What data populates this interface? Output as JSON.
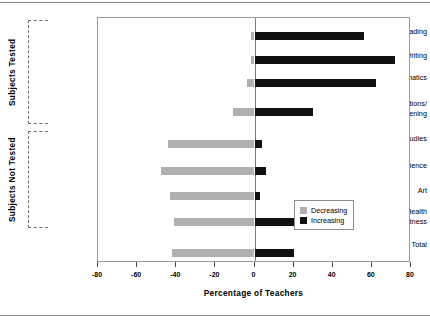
{
  "chart_data": {
    "type": "bar",
    "orientation": "horizontal",
    "title": "",
    "xlabel": "Percentage of Teachers",
    "ylabel": "",
    "xlim": [
      -80,
      80
    ],
    "xticks": [
      -80,
      -60,
      -40,
      -20,
      0,
      20,
      40,
      60,
      80
    ],
    "xtick_labels": [
      "-80",
      "-60",
      "-40",
      "-20",
      "0",
      "20",
      "40",
      "60",
      "80"
    ],
    "grid": false,
    "legend_position": "center right",
    "categories": [
      "Reading",
      "Writing",
      "Mathematics",
      "Communications/ Listening",
      "Social Studies",
      "Science",
      "Art",
      "Health and Fitness",
      "Total"
    ],
    "series": [
      {
        "name": "Decreasing",
        "color": "#b0b0b0",
        "values": [
          -2,
          -2,
          -4,
          -11,
          -44,
          -48,
          -43,
          -41,
          -42
        ]
      },
      {
        "name": "Increasing",
        "color": "#111111",
        "values": [
          56,
          72,
          62,
          30,
          4,
          6,
          3,
          20,
          20
        ]
      }
    ],
    "groups": [
      {
        "label": "Subjects Tested",
        "categories": [
          "Reading",
          "Writing",
          "Mathematics",
          "Communications/ Listening"
        ]
      },
      {
        "label": "Subjects Not Tested",
        "categories": [
          "Social Studies",
          "Science",
          "Art",
          "Health and Fitness"
        ]
      }
    ]
  },
  "axis": {
    "x_title": "Percentage of Teachers"
  },
  "categories": [
    {
      "line1": "Reading",
      "line2": ""
    },
    {
      "line1": "Writing",
      "line2": ""
    },
    {
      "line1": "Mathematics",
      "line2": ""
    },
    {
      "line1": "Communications/",
      "line2": "Listening"
    },
    {
      "line1": "Social  Studies",
      "line2": ""
    },
    {
      "line1": "Science",
      "line2": ""
    },
    {
      "line1": "Art",
      "line2": ""
    },
    {
      "line1": "Health",
      "line2": "and Fitness"
    },
    {
      "line1": "Total",
      "line2": ""
    }
  ],
  "groups": [
    {
      "label": "Subjects Tested"
    },
    {
      "label": "Subjects Not Tested"
    }
  ],
  "legend": {
    "items": [
      {
        "label": "Decreasing",
        "color": "#b0b0b0"
      },
      {
        "label": "Increasing",
        "color": "#111111"
      }
    ]
  },
  "ticks": [
    {
      "label": "-80"
    },
    {
      "label": "-60"
    },
    {
      "label": "-40"
    },
    {
      "label": "-20"
    },
    {
      "label": "0"
    },
    {
      "label": "20"
    },
    {
      "label": "40"
    },
    {
      "label": "60"
    },
    {
      "label": "80"
    }
  ]
}
